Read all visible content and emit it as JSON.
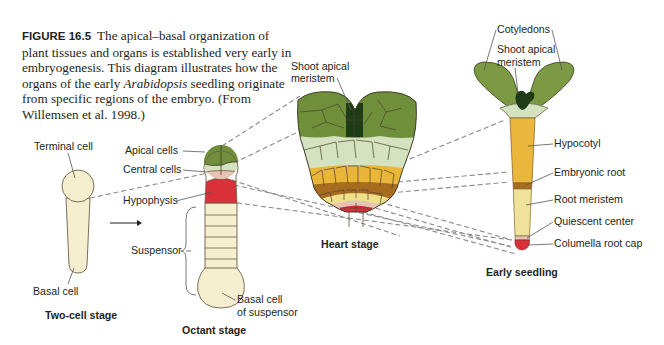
{
  "caption": {
    "figure_label": "FIGURE 16.5",
    "text_part1": "The apical–basal organization of plant tissues and organs is established very early in embryogenesis. This diagram illustrates how the organs of the early ",
    "italic": "Arabidopsis",
    "text_part2": " seedling originate from specific regions of the embryo. (From Willemsen et al. 1998.)"
  },
  "stages": {
    "two_cell": {
      "title": "Two-cell stage",
      "labels": {
        "terminal_cell": "Terminal cell",
        "basal_cell": "Basal cell"
      }
    },
    "octant": {
      "title": "Octant stage",
      "labels": {
        "apical_cells": "Apical cells",
        "central_cells": "Central cells",
        "hypophysis": "Hypophysis",
        "suspensor": "Suspensor",
        "basal_cell_line1": "Basal cell",
        "basal_cell_line2": "of suspensor"
      }
    },
    "heart": {
      "title": "Heart stage",
      "labels": {
        "sam_line1": "Shoot apical",
        "sam_line2": "meristem"
      }
    },
    "seedling": {
      "title": "Early seedling",
      "labels": {
        "cotyledons": "Cotyledons",
        "sam_line1": "Shoot apical",
        "sam_line2": "meristem",
        "hypocotyl": "Hypocotyl",
        "embryonic_root": "Embryonic root",
        "root_meristem": "Root meristem",
        "quiescent_center": "Quiescent center",
        "columella_root_cap": "Columella root cap"
      }
    }
  },
  "colors": {
    "cream": "#f6efcf",
    "apical_green": "#6f8f3a",
    "dark_green": "#1e3d17",
    "pale_green": "#d4e2bf",
    "orange_yellow": "#eab63a",
    "brown": "#a86c1e",
    "pale_yellow": "#efe08a",
    "pink": "#e6c3b2",
    "red": "#d9303a",
    "hypocotyl": "#eab73c",
    "root_meristem": "#f0e29a"
  }
}
